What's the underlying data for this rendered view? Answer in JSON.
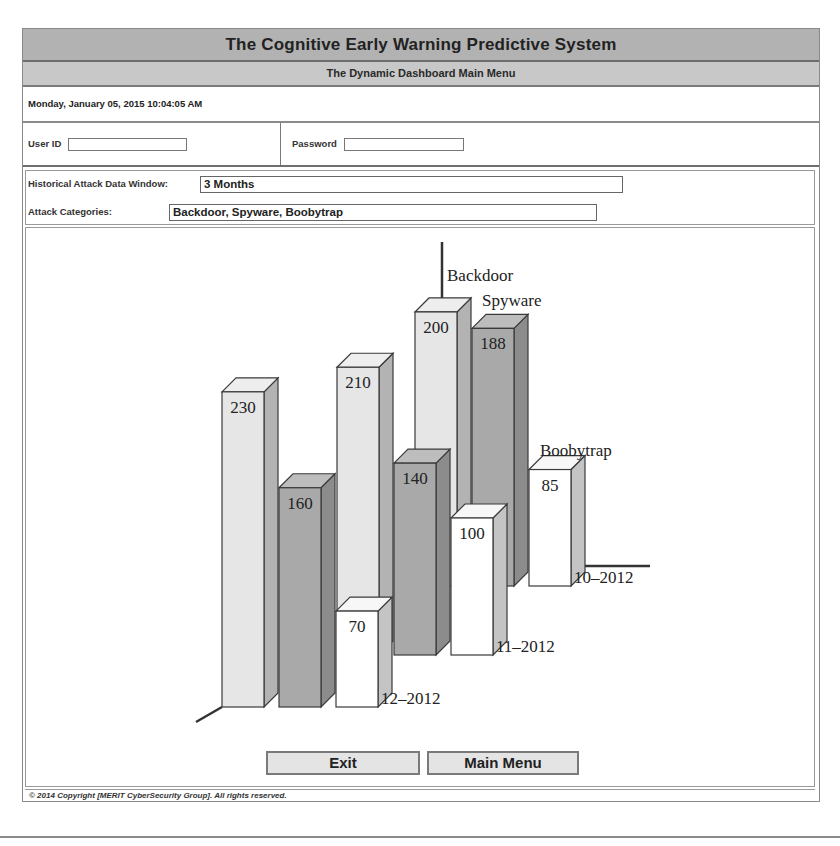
{
  "header": {
    "title": "The Cognitive Early Warning Predictive System",
    "subtitle": "The Dynamic Dashboard Main Menu"
  },
  "datetime": "Monday, January 05, 2015 10:04:05 AM",
  "login": {
    "user_id_label": "User ID",
    "user_id_value": "",
    "password_label": "Password",
    "password_value": ""
  },
  "params": {
    "window_label": "Historical Attack Data Window:",
    "window_value": "3 Months",
    "categories_label": "Attack Categories:",
    "categories_value": "Backdoor, Spyware, Boobytrap"
  },
  "buttons": {
    "exit": "Exit",
    "main_menu": "Main Menu"
  },
  "footer": {
    "copyright": "© 2014 Copyright  [MERIT CyberSecurity Group]. All rights reserved."
  },
  "colors": {
    "title_bg": "#b2b2b2",
    "subtitle_bg": "#c8c8c8",
    "backdoor": "#e6e6e6",
    "spyware": "#a9a9a9",
    "boobytrap": "#ffffff"
  },
  "chart_data": {
    "type": "bar",
    "variant": "3d-grouped-depth",
    "title": "",
    "categories": [
      "12-2012",
      "11-2012",
      "10-2012"
    ],
    "category_labels": [
      "12–2012",
      "11–2012",
      "10–2012"
    ],
    "series": [
      {
        "name": "Backdoor",
        "values": [
          230,
          210,
          200
        ]
      },
      {
        "name": "Spyware",
        "values": [
          160,
          140,
          188
        ]
      },
      {
        "name": "Boobytrap",
        "values": [
          70,
          100,
          85
        ]
      }
    ],
    "series_labels": [
      "Backdoor",
      "Spyware",
      "Boobytrap"
    ],
    "xlabel": "",
    "ylabel": "",
    "grid": false,
    "legend": "inline labels at back of each series row",
    "data_labels": true
  }
}
